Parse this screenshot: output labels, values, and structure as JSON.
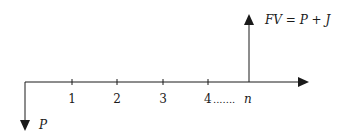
{
  "diagram": {
    "type": "cash-flow-timeline",
    "present_value_label": "P",
    "future_value_label": "FV = P + J",
    "periods": [
      "1",
      "2",
      "3",
      "4"
    ],
    "ellipsis": ".......",
    "final_period_label": "n",
    "colors": {
      "stroke": "#1a1a1a",
      "background": "#ffffff"
    }
  }
}
